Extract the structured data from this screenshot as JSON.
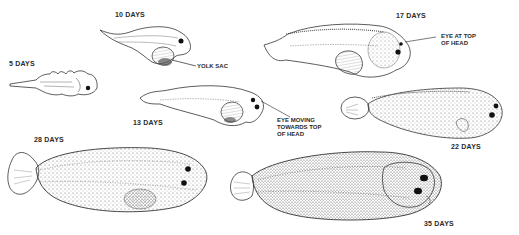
{
  "figure": {
    "stages": [
      {
        "id": "5d",
        "label": "5 DAYS"
      },
      {
        "id": "10d",
        "label": "10 DAYS"
      },
      {
        "id": "13d",
        "label": "13 DAYS"
      },
      {
        "id": "17d",
        "label": "17 DAYS"
      },
      {
        "id": "22d",
        "label": "22 DAYS"
      },
      {
        "id": "28d",
        "label": "28 DAYS"
      },
      {
        "id": "35d",
        "label": "35 DAYS"
      }
    ],
    "annotations": [
      {
        "id": "yolk",
        "text": "YOLK SAC"
      },
      {
        "id": "eye_moving",
        "text": "EYE MOVING\nTOWARDS TOP\nOF HEAD"
      },
      {
        "id": "eye_top",
        "text": "EYE AT TOP\nOF HEAD"
      }
    ]
  }
}
